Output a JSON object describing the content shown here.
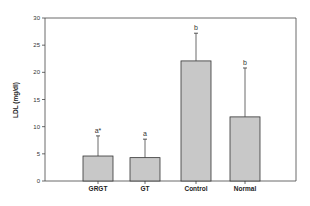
{
  "chart_data": {
    "type": "bar",
    "title": "",
    "xlabel": "",
    "ylabel": "LDL (mg/dl)",
    "ylim": [
      0,
      30
    ],
    "yticks": [
      0,
      5,
      10,
      15,
      20,
      25,
      30
    ],
    "grid": false,
    "legend": null,
    "categories": [
      "GRGT",
      "GT",
      "Control",
      "Normal"
    ],
    "values": [
      4.6,
      4.3,
      22.1,
      11.8
    ],
    "error_upper": [
      3.7,
      3.4,
      5.1,
      9.0
    ],
    "error_top": [
      8.3,
      7.7,
      27.2,
      20.8
    ],
    "significance_labels": [
      "a*",
      "a",
      "b",
      "b"
    ],
    "bar_color": "#c8c8c8",
    "bar_edge_color": "#333333"
  }
}
